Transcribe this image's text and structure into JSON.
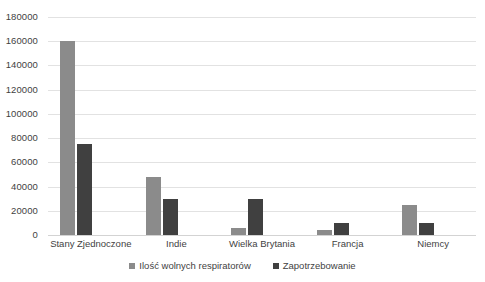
{
  "chart_data": {
    "type": "bar",
    "title": "",
    "subtitle": "",
    "xlabel": "",
    "ylabel": "",
    "ylim": [
      0,
      180000
    ],
    "ytick_step": 20000,
    "yticks": [
      "0",
      "20000",
      "40000",
      "60000",
      "80000",
      "100000",
      "120000",
      "140000",
      "160000",
      "180000"
    ],
    "grid": true,
    "legend_position": "bottom",
    "categories": [
      "Stany Zjednoczone",
      "Indie",
      "Wielka Brytania",
      "Francja",
      "Niemcy"
    ],
    "series": [
      {
        "name": "Ilość wolnych respiratorów",
        "color": "#8b8b8b",
        "values": [
          160000,
          47500,
          5500,
          4500,
          25000
        ]
      },
      {
        "name": "Zapotrzebowanie",
        "color": "#404040",
        "values": [
          75000,
          30000,
          30000,
          10000,
          10000
        ]
      }
    ]
  },
  "legend": {
    "items": [
      {
        "label": "Ilość wolnych respiratorów",
        "marker": "square-swatch-light"
      },
      {
        "label": "Zapotrzebowanie",
        "marker": "square-swatch-dark"
      }
    ]
  },
  "colors": {
    "series_light": "#8b8b8b",
    "series_dark": "#404040",
    "gridline": "#e2e2e2",
    "baseline": "#d3d3d3",
    "text": "#3f3f3f",
    "background": "#ffffff"
  }
}
